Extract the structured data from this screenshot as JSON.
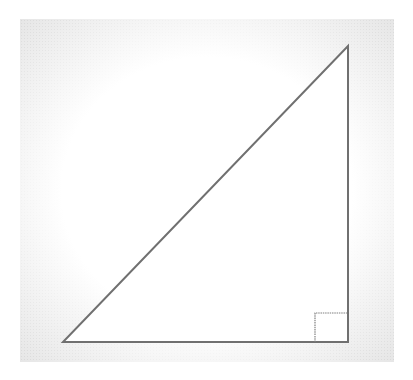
{
  "diagram": {
    "type": "right-triangle",
    "colors": {
      "stroke": "#707070",
      "marker_stroke": "#808080",
      "fill": "#ffffff",
      "vignette": "#e6e6e6"
    },
    "vertices": {
      "left": [
        63,
        342
      ],
      "right_angle": [
        348,
        342
      ],
      "top": [
        348,
        46
      ]
    },
    "right_angle_marker": {
      "x": 315,
      "y": 313,
      "size": 33
    },
    "labels": []
  }
}
